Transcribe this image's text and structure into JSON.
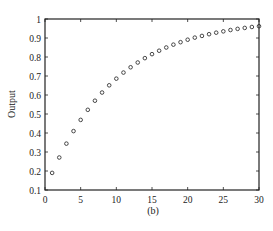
{
  "chart_data": {
    "type": "scatter",
    "title": "",
    "caption": "(b)",
    "xlabel": "",
    "ylabel": "Output",
    "xlim": [
      0,
      30
    ],
    "ylim": [
      0.1,
      1
    ],
    "xticks": [
      0,
      5,
      10,
      15,
      20,
      25,
      30
    ],
    "yticks": [
      0.1,
      0.2,
      0.3,
      0.4,
      0.5,
      0.6,
      0.7,
      0.8,
      0.9,
      1
    ],
    "ytick_labels": [
      "0.1",
      "0.2",
      "0.3",
      "0.4",
      "0.5",
      "0.6",
      "0.7",
      "0.8",
      "0.9",
      "1"
    ],
    "grid": false,
    "legend": null,
    "marker": "open-circle",
    "series": [
      {
        "name": "Output",
        "x": [
          1,
          2,
          3,
          4,
          5,
          6,
          7,
          8,
          9,
          10,
          11,
          12,
          13,
          14,
          15,
          16,
          17,
          18,
          19,
          20,
          21,
          22,
          23,
          24,
          25,
          26,
          27,
          28,
          29,
          30
        ],
        "values": [
          0.19,
          0.271,
          0.344,
          0.41,
          0.469,
          0.522,
          0.57,
          0.613,
          0.651,
          0.686,
          0.718,
          0.746,
          0.771,
          0.794,
          0.815,
          0.833,
          0.85,
          0.865,
          0.878,
          0.891,
          0.902,
          0.911,
          0.92,
          0.928,
          0.935,
          0.942,
          0.948,
          0.953,
          0.958,
          0.962
        ]
      }
    ]
  },
  "colors": {
    "axis": "#222222",
    "marker": "#333333",
    "background": "#ffffff"
  }
}
